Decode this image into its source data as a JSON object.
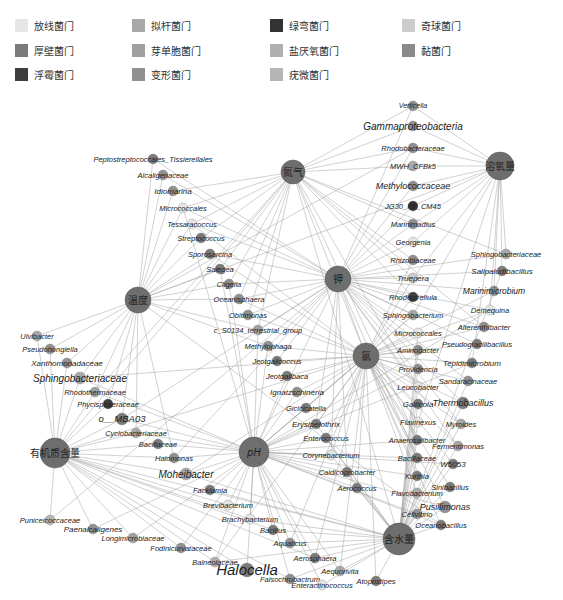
{
  "legend": [
    {
      "label": "放线菌门",
      "color": "#e6e6e6"
    },
    {
      "label": "拟杆菌门",
      "color": "#a8a8a8"
    },
    {
      "label": "绿弯菌门",
      "color": "#333333"
    },
    {
      "label": "奇球菌门",
      "color": "#cccccc"
    },
    {
      "label": "厚壁菌门",
      "color": "#7a7a7a"
    },
    {
      "label": "芽单胞菌门",
      "color": "#a0a0a0"
    },
    {
      "label": "盐厌氧菌门",
      "color": "#b0b0b0"
    },
    {
      "label": "黏菌门",
      "color": "#8a8a8a"
    },
    {
      "label": "浮霉菌门",
      "color": "#3e3e3e"
    },
    {
      "label": "变形菌门",
      "color": "#909090"
    },
    {
      "label": "疣微菌门",
      "color": "#b5b5b5"
    }
  ],
  "hubs": [
    {
      "id": "N",
      "label": "氮气",
      "x": 293,
      "y": 172,
      "r": 12
    },
    {
      "id": "O2",
      "label": "溶氧量",
      "x": 500,
      "y": 166,
      "r": 14
    },
    {
      "id": "K",
      "label": "钾",
      "x": 338,
      "y": 279,
      "r": 13
    },
    {
      "id": "T",
      "label": "温度",
      "x": 138,
      "y": 300,
      "r": 13
    },
    {
      "id": "Na",
      "label": "氯",
      "x": 366,
      "y": 356,
      "r": 13
    },
    {
      "id": "pH",
      "label": "pH",
      "x": 254,
      "y": 452,
      "r": 15
    },
    {
      "id": "OM",
      "label": "有机质含量",
      "x": 55,
      "y": 453,
      "r": 15
    },
    {
      "id": "W",
      "label": "含水量",
      "x": 399,
      "y": 539,
      "r": 16
    }
  ],
  "nodes": [
    {
      "label": "Verticella",
      "x": 413,
      "y": 106,
      "r": 5,
      "color": "#909090",
      "size": 7
    },
    {
      "label": "Gammaproteobacteria",
      "x": 413,
      "y": 126,
      "r": 5,
      "color": "#909090",
      "size": 10
    },
    {
      "label": "Rhodobacteraceae",
      "x": 413,
      "y": 148,
      "r": 5,
      "color": "#909090",
      "size": 7.5
    },
    {
      "label": "MWH_CFBk5",
      "x": 413,
      "y": 166,
      "r": 5,
      "color": "#a8a8a8",
      "size": 7.5
    },
    {
      "label": "Methylococcaceae",
      "x": 413,
      "y": 186,
      "r": 5,
      "color": "#909090",
      "size": 9
    },
    {
      "label": "JG30_KF_CM45",
      "x": 413,
      "y": 206,
      "r": 5,
      "color": "#333333",
      "size": 7.5
    },
    {
      "label": "Marinimadius",
      "x": 413,
      "y": 224,
      "r": 5,
      "color": "#909090",
      "size": 7.5
    },
    {
      "label": "Georgenia",
      "x": 413,
      "y": 242,
      "r": 5,
      "color": "#e6e6e6",
      "size": 7.5
    },
    {
      "label": "Rhizobiaceae",
      "x": 413,
      "y": 260,
      "r": 5,
      "color": "#909090",
      "size": 7.5
    },
    {
      "label": "Truepera",
      "x": 413,
      "y": 278,
      "r": 5,
      "color": "#cccccc",
      "size": 8
    },
    {
      "label": "Rhodopirellula",
      "x": 413,
      "y": 297,
      "r": 5,
      "color": "#3e3e3e",
      "size": 7.5
    },
    {
      "label": "Sphingobacterium",
      "x": 413,
      "y": 315,
      "r": 5,
      "color": "#a8a8a8",
      "size": 7.5
    },
    {
      "label": "Micrococcales",
      "x": 418,
      "y": 333,
      "r": 5,
      "color": "#e6e6e6",
      "size": 7.5
    },
    {
      "label": "Aminobacter",
      "x": 418,
      "y": 350,
      "r": 5,
      "color": "#909090",
      "size": 7.5
    },
    {
      "label": "Providencia",
      "x": 418,
      "y": 369,
      "r": 5,
      "color": "#909090",
      "size": 7.5
    },
    {
      "label": "Leucobacter",
      "x": 418,
      "y": 387,
      "r": 5,
      "color": "#e6e6e6",
      "size": 7.5
    },
    {
      "label": "Gallicola",
      "x": 418,
      "y": 404,
      "r": 5,
      "color": "#7a7a7a",
      "size": 8
    },
    {
      "label": "Flavinexus",
      "x": 418,
      "y": 422,
      "r": 5,
      "color": "#e6e6e6",
      "size": 7.5
    },
    {
      "label": "Anaerosalibacter",
      "x": 417,
      "y": 440,
      "r": 5,
      "color": "#7a7a7a",
      "size": 7.5
    },
    {
      "label": "Bacillaceae",
      "x": 417,
      "y": 458,
      "r": 5,
      "color": "#7a7a7a",
      "size": 7.5
    },
    {
      "label": "Kurthia",
      "x": 417,
      "y": 476,
      "r": 5,
      "color": "#7a7a7a",
      "size": 7.5
    },
    {
      "label": "Flavobacterium",
      "x": 417,
      "y": 493,
      "r": 5,
      "color": "#a8a8a8",
      "size": 7.5
    },
    {
      "label": "Cellvibrio",
      "x": 417,
      "y": 514,
      "r": 5,
      "color": "#909090",
      "size": 7.5
    },
    {
      "label": "Sphingobacteriaceae",
      "x": 506,
      "y": 254,
      "r": 5,
      "color": "#a8a8a8",
      "size": 7.5
    },
    {
      "label": "Salipaludibacillus",
      "x": 502,
      "y": 271,
      "r": 5,
      "color": "#7a7a7a",
      "size": 8
    },
    {
      "label": "Marinimicrobium",
      "x": 494,
      "y": 291,
      "r": 5,
      "color": "#909090",
      "size": 8.5
    },
    {
      "label": "Demequina",
      "x": 490,
      "y": 310,
      "r": 5,
      "color": "#e6e6e6",
      "size": 7.5
    },
    {
      "label": "Alterenthibacter",
      "x": 484,
      "y": 327,
      "r": 5,
      "color": "#909090",
      "size": 7.5
    },
    {
      "label": "Pseudogracilibacillus",
      "x": 477,
      "y": 344,
      "r": 5,
      "color": "#7a7a7a",
      "size": 7.5
    },
    {
      "label": "Tepidimicrobium",
      "x": 472,
      "y": 363,
      "r": 5,
      "color": "#7a7a7a",
      "size": 8
    },
    {
      "label": "Sandaracinaceae",
      "x": 468,
      "y": 381,
      "r": 5,
      "color": "#909090",
      "size": 7.5
    },
    {
      "label": "Thermobacillus",
      "x": 463,
      "y": 403,
      "r": 6,
      "color": "#7a7a7a",
      "size": 9
    },
    {
      "label": "Myroides",
      "x": 461,
      "y": 424,
      "r": 5,
      "color": "#a8a8a8",
      "size": 7.5
    },
    {
      "label": "Fermentimonas",
      "x": 458,
      "y": 446,
      "r": 5,
      "color": "#a8a8a8",
      "size": 7.5
    },
    {
      "label": "W5053",
      "x": 453,
      "y": 464,
      "r": 5,
      "color": "#7a7a7a",
      "size": 8
    },
    {
      "label": "Sinibacillus",
      "x": 450,
      "y": 487,
      "r": 5,
      "color": "#7a7a7a",
      "size": 7.5
    },
    {
      "label": "Pusillimonas",
      "x": 445,
      "y": 507,
      "r": 6,
      "color": "#909090",
      "size": 9
    },
    {
      "label": "Oceanobacillus",
      "x": 441,
      "y": 525,
      "r": 5,
      "color": "#7a7a7a",
      "size": 7.5
    },
    {
      "label": "Peptostreptococcales_Tissierellales",
      "x": 153,
      "y": 159,
      "r": 5,
      "color": "#7a7a7a",
      "size": 7.5
    },
    {
      "label": "Alcaligenaceae",
      "x": 163,
      "y": 175,
      "r": 5,
      "color": "#909090",
      "size": 7.5
    },
    {
      "label": "Idiomarina",
      "x": 173,
      "y": 191,
      "r": 5,
      "color": "#909090",
      "size": 8
    },
    {
      "label": "Micrococcales",
      "x": 183,
      "y": 208,
      "r": 5,
      "color": "#e6e6e6",
      "size": 7.5
    },
    {
      "label": "Tessaracoccus",
      "x": 192,
      "y": 224,
      "r": 5,
      "color": "#e6e6e6",
      "size": 7.5
    },
    {
      "label": "Streptococcus",
      "x": 201,
      "y": 238,
      "r": 5,
      "color": "#7a7a7a",
      "size": 7.5
    },
    {
      "label": "Sporosarcina",
      "x": 210,
      "y": 254,
      "r": 5,
      "color": "#7a7a7a",
      "size": 7.5
    },
    {
      "label": "Salegea",
      "x": 220,
      "y": 269,
      "r": 5,
      "color": "#7a7a7a",
      "size": 7.5
    },
    {
      "label": "Cligella",
      "x": 229,
      "y": 284,
      "r": 5,
      "color": "#909090",
      "size": 7.5
    },
    {
      "label": "Oceanisphaera",
      "x": 239,
      "y": 299,
      "r": 5,
      "color": "#909090",
      "size": 7.5
    },
    {
      "label": "Obitimonas",
      "x": 248,
      "y": 315,
      "r": 5,
      "color": "#909090",
      "size": 7.5
    },
    {
      "label": "c_S0134_terrestrial_group",
      "x": 258,
      "y": 330,
      "r": 5,
      "color": "#a0a0a0",
      "size": 7.5
    },
    {
      "label": "Methylophaga",
      "x": 268,
      "y": 346,
      "r": 5,
      "color": "#909090",
      "size": 7.5
    },
    {
      "label": "Jeotgalicoccus",
      "x": 277,
      "y": 361,
      "r": 5,
      "color": "#7a7a7a",
      "size": 7.5
    },
    {
      "label": "Jeotgalibaca",
      "x": 287,
      "y": 376,
      "r": 5,
      "color": "#7a7a7a",
      "size": 7.5
    },
    {
      "label": "Ignatzschineria",
      "x": 297,
      "y": 392,
      "r": 5,
      "color": "#909090",
      "size": 8
    },
    {
      "label": "Gicicicatella",
      "x": 306,
      "y": 408,
      "r": 5,
      "color": "#7a7a7a",
      "size": 7.5
    },
    {
      "label": "Erysipelothrix",
      "x": 316,
      "y": 424,
      "r": 5,
      "color": "#7a7a7a",
      "size": 8
    },
    {
      "label": "Enterococcus",
      "x": 326,
      "y": 438,
      "r": 5,
      "color": "#7a7a7a",
      "size": 7.5
    },
    {
      "label": "Corynebacterium",
      "x": 331,
      "y": 455,
      "r": 5,
      "color": "#e6e6e6",
      "size": 7.5
    },
    {
      "label": "Caldicoprobacter",
      "x": 347,
      "y": 472,
      "r": 5,
      "color": "#7a7a7a",
      "size": 7.5
    },
    {
      "label": "Aerococcus",
      "x": 357,
      "y": 488,
      "r": 5,
      "color": "#7a7a7a",
      "size": 7.5
    },
    {
      "label": "Ulvibacter",
      "x": 37,
      "y": 336,
      "r": 5,
      "color": "#a8a8a8",
      "size": 7.5
    },
    {
      "label": "Pseudohongiella",
      "x": 50,
      "y": 349,
      "r": 5,
      "color": "#909090",
      "size": 7.5
    },
    {
      "label": "Xanthomonadaceae",
      "x": 67,
      "y": 363,
      "r": 5,
      "color": "#909090",
      "size": 8
    },
    {
      "label": "Sphingobacteriaceae",
      "x": 80,
      "y": 378,
      "r": 6,
      "color": "#a8a8a8",
      "size": 10
    },
    {
      "label": "Rhodothermaceae",
      "x": 95,
      "y": 392,
      "r": 5,
      "color": "#a0a0a0",
      "size": 7.5
    },
    {
      "label": "Phycisphaeraceae",
      "x": 108,
      "y": 404,
      "r": 5,
      "color": "#3e3e3e",
      "size": 7.5
    },
    {
      "label": "o__MBA03",
      "x": 122,
      "y": 419,
      "r": 6,
      "color": "#7a7a7a",
      "size": 9.5
    },
    {
      "label": "Cyclobacteriaceae",
      "x": 136,
      "y": 433,
      "r": 5,
      "color": "#a8a8a8",
      "size": 7.5
    },
    {
      "label": "Bacillaceae",
      "x": 158,
      "y": 444,
      "r": 5,
      "color": "#7a7a7a",
      "size": 7.5
    },
    {
      "label": "Halomonas",
      "x": 174,
      "y": 458,
      "r": 5,
      "color": "#909090",
      "size": 7.5
    },
    {
      "label": "Moheibacter",
      "x": 186,
      "y": 474,
      "r": 6,
      "color": "#a8a8a8",
      "size": 10
    },
    {
      "label": "Facklamia",
      "x": 210,
      "y": 490,
      "r": 5,
      "color": "#7a7a7a",
      "size": 7.5
    },
    {
      "label": "Brevibacterium",
      "x": 228,
      "y": 505,
      "r": 5,
      "color": "#e6e6e6",
      "size": 7.5
    },
    {
      "label": "Brachybacterium",
      "x": 250,
      "y": 519,
      "r": 5,
      "color": "#e6e6e6",
      "size": 7.5
    },
    {
      "label": "Bacillus",
      "x": 273,
      "y": 530,
      "r": 5,
      "color": "#7a7a7a",
      "size": 7.5
    },
    {
      "label": "Aquaticus",
      "x": 290,
      "y": 543,
      "r": 5,
      "color": "#909090",
      "size": 7.5
    },
    {
      "label": "Aerosphaera",
      "x": 315,
      "y": 558,
      "r": 5,
      "color": "#7a7a7a",
      "size": 7.5
    },
    {
      "label": "Aequorivita",
      "x": 340,
      "y": 571,
      "r": 5,
      "color": "#a8a8a8",
      "size": 7.5
    },
    {
      "label": "Atopostipes",
      "x": 376,
      "y": 581,
      "r": 5,
      "color": "#7a7a7a",
      "size": 7.5
    },
    {
      "label": "Puniceicoccaceae",
      "x": 50,
      "y": 520,
      "r": 5,
      "color": "#b5b5b5",
      "size": 7.5
    },
    {
      "label": "Paenalcaligenes",
      "x": 93,
      "y": 529,
      "r": 5,
      "color": "#909090",
      "size": 8
    },
    {
      "label": "Longimicrobiaceae",
      "x": 133,
      "y": 538,
      "r": 5,
      "color": "#a0a0a0",
      "size": 7.5
    },
    {
      "label": "Fodinicurvataceae",
      "x": 181,
      "y": 548,
      "r": 5,
      "color": "#909090",
      "size": 7.5
    },
    {
      "label": "Balneolaceae",
      "x": 215,
      "y": 562,
      "r": 5,
      "color": "#b0b0b0",
      "size": 7.5
    },
    {
      "label": "Halocella",
      "x": 247,
      "y": 570,
      "r": 7,
      "color": "#7a7a7a",
      "size": 15
    },
    {
      "label": "Falsochrobactrum",
      "x": 290,
      "y": 579,
      "r": 5,
      "color": "#909090",
      "size": 7.5
    },
    {
      "label": "Enteractinococcus",
      "x": 322,
      "y": 585,
      "r": 5,
      "color": "#e6e6e6",
      "size": 7.5
    }
  ]
}
